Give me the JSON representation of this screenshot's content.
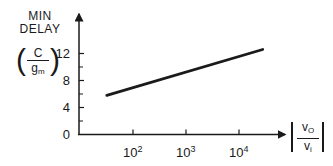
{
  "chart_data": {
    "type": "line",
    "title": "",
    "ylabel": "MIN DELAY (C/gm)",
    "ylabel_lines": [
      "MIN",
      "DELAY"
    ],
    "ylabel_fraction": {
      "numerator": "C",
      "denominator": "g",
      "denominator_sub": "m"
    },
    "xlabel": "|vo/vi|",
    "xlabel_fraction": {
      "numerator": "v",
      "numerator_sub": "O",
      "denominator": "v",
      "denominator_sub": "i"
    },
    "xscale": "log",
    "yscale": "linear",
    "yticks": [
      0,
      4,
      8,
      12
    ],
    "ytick_labels": [
      "0",
      "4",
      "8",
      "12"
    ],
    "yminor_ticks": [
      2,
      6,
      10
    ],
    "xticks": [
      100,
      1000,
      10000
    ],
    "xtick_labels": [
      {
        "base": "10",
        "exp": "2"
      },
      {
        "base": "10",
        "exp": "3"
      },
      {
        "base": "10",
        "exp": "4"
      }
    ],
    "ylim": [
      0,
      15
    ],
    "xlim": [
      10,
      100000
    ],
    "grid": false,
    "legend": null,
    "series": [
      {
        "name": "min delay",
        "x": [
          32,
          28000
        ],
        "y": [
          5.8,
          12.6
        ]
      }
    ]
  },
  "colors": {
    "ink": "#1a1a1a",
    "background": "#ffffff"
  }
}
